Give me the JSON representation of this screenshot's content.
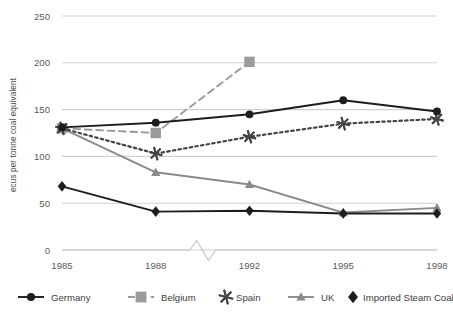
{
  "chart_data": {
    "type": "line",
    "title": "",
    "xlabel": "",
    "ylabel": "ecus per tonne coal equivalent",
    "categories": [
      "1985",
      "1988",
      "1992",
      "1995",
      "1998"
    ],
    "x_axis_break": true,
    "x_axis_break_between": [
      "1988",
      "1992"
    ],
    "ylim": [
      0,
      250
    ],
    "yticks": [
      0,
      50,
      100,
      150,
      200,
      250
    ],
    "ytick_labels": [
      "0",
      "50",
      "100",
      "150",
      "200",
      "250"
    ],
    "grid": "horizontal",
    "legend_position": "bottom",
    "series": [
      {
        "name": "Germany",
        "values": [
          131,
          136,
          145,
          160,
          148
        ],
        "color": "#1d1d1d",
        "line_style": "solid",
        "marker": "circle"
      },
      {
        "name": "Belgium",
        "values": [
          130,
          125,
          201,
          null,
          null
        ],
        "color": "#9a9a9a",
        "line_style": "dashed",
        "marker": "square"
      },
      {
        "name": "Spain",
        "values": [
          130,
          103,
          121,
          135,
          140
        ],
        "color": "#444444",
        "line_style": "dotted",
        "marker": "asterisk"
      },
      {
        "name": "UK",
        "values": [
          130,
          83,
          70,
          40,
          45
        ],
        "color": "#8a8a8a",
        "line_style": "solid",
        "marker": "triangle"
      },
      {
        "name": "Imported Steam Coal",
        "values": [
          68,
          41,
          42,
          39,
          39
        ],
        "color": "#1d1d1d",
        "line_style": "solid",
        "marker": "diamond"
      }
    ]
  },
  "legend": {
    "items": [
      {
        "label": "Germany",
        "marker_name": "circle-marker-icon"
      },
      {
        "label": "Belgium",
        "marker_name": "square-marker-icon"
      },
      {
        "label": "Spain",
        "marker_name": "asterisk-marker-icon"
      },
      {
        "label": "UK",
        "marker_name": "triangle-marker-icon"
      },
      {
        "label": "Imported Steam Coal",
        "marker_name": "diamond-marker-icon"
      }
    ]
  },
  "colors": {
    "gridline": "#d0d0d0",
    "axis": "#c8c8c8",
    "background": "#ffffff",
    "text": "#4a4a4a"
  }
}
